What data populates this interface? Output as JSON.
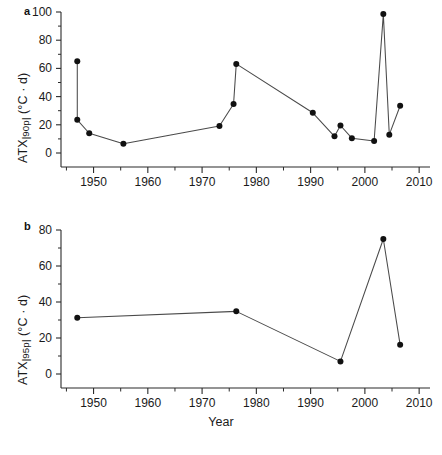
{
  "figure": {
    "xlabel": "Year",
    "panel_a_label": "a",
    "panel_b_label": "b"
  },
  "chart_data": [
    {
      "type": "line",
      "panel": "a",
      "title": "",
      "xlabel": "Year",
      "ylabel": "ATX|90p| (°C · d)",
      "ylabel_base": "ATX",
      "ylabel_sub": "|90p|",
      "ylabel_units": " (°C · d)",
      "xlim": [
        1944,
        2012
      ],
      "ylim": [
        0,
        100
      ],
      "yticks": [
        0,
        20,
        40,
        60,
        80,
        100
      ],
      "ytick_labels": [
        "0",
        "20",
        "40",
        "60",
        "80",
        "100"
      ],
      "xticks": [
        1950,
        1960,
        1970,
        1980,
        1990,
        2000,
        2010
      ],
      "xtick_labels": [
        "1950",
        "1960",
        "1970",
        "1980",
        "1990",
        "2000",
        "2010"
      ],
      "minor_xticks": [
        1945,
        1955,
        1965,
        1975,
        1985,
        1995,
        2005
      ],
      "minor_yticks": [
        10,
        30,
        50,
        70,
        90
      ],
      "grid": false,
      "legend": null,
      "marker": "filled-circle",
      "x": [
        1947.0,
        1947.0,
        1949.2,
        1955.5,
        1973.2,
        1975.8,
        1976.3,
        1990.4,
        1994.4,
        1995.5,
        1997.6,
        2001.7,
        2003.4,
        2004.5,
        2006.5
      ],
      "y": [
        65.0,
        23.5,
        14.0,
        6.5,
        19.2,
        34.7,
        63.2,
        28.5,
        11.8,
        19.5,
        10.5,
        8.5,
        98.5,
        13.0,
        33.5
      ]
    },
    {
      "type": "line",
      "panel": "b",
      "title": "",
      "xlabel": "Year",
      "ylabel": "ATX|95p| (°C · d)",
      "ylabel_base": "ATX",
      "ylabel_sub": "|95p|",
      "ylabel_units": " (°C · d)",
      "xlim": [
        1944,
        2012
      ],
      "ylim": [
        0,
        80
      ],
      "yticks": [
        0,
        20,
        40,
        60,
        80
      ],
      "ytick_labels": [
        "0",
        "20",
        "40",
        "60",
        "80"
      ],
      "xticks": [
        1950,
        1960,
        1970,
        1980,
        1990,
        2000,
        2010
      ],
      "xtick_labels": [
        "1950",
        "1960",
        "1970",
        "1980",
        "1990",
        "2000",
        "2010"
      ],
      "minor_xticks": [
        1945,
        1955,
        1965,
        1975,
        1985,
        1995,
        2005
      ],
      "minor_yticks": [
        10,
        30,
        50,
        70
      ],
      "grid": false,
      "legend": null,
      "marker": "filled-circle",
      "x": [
        1947.0,
        1976.3,
        1995.5,
        2003.4,
        2006.5
      ],
      "y": [
        31.3,
        34.8,
        7.0,
        75.0,
        16.2
      ]
    }
  ]
}
